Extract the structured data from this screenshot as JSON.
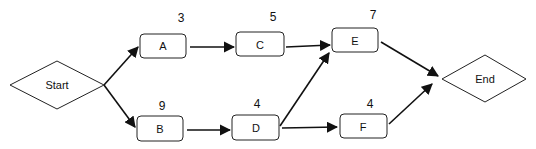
{
  "diagram": {
    "type": "activity-network",
    "nodes": [
      {
        "id": "start",
        "label": "Start",
        "shape": "diamond"
      },
      {
        "id": "A",
        "label": "A",
        "duration": "3"
      },
      {
        "id": "B",
        "label": "B",
        "duration": "9"
      },
      {
        "id": "C",
        "label": "C",
        "duration": "5"
      },
      {
        "id": "D",
        "label": "D",
        "duration": "4"
      },
      {
        "id": "E",
        "label": "E",
        "duration": "7"
      },
      {
        "id": "F",
        "label": "F",
        "duration": "4"
      },
      {
        "id": "end",
        "label": "End",
        "shape": "diamond"
      }
    ],
    "edges": [
      [
        "Start",
        "A"
      ],
      [
        "Start",
        "B"
      ],
      [
        "A",
        "C"
      ],
      [
        "B",
        "D"
      ],
      [
        "C",
        "E"
      ],
      [
        "D",
        "E"
      ],
      [
        "D",
        "F"
      ],
      [
        "E",
        "End"
      ],
      [
        "F",
        "End"
      ]
    ]
  }
}
